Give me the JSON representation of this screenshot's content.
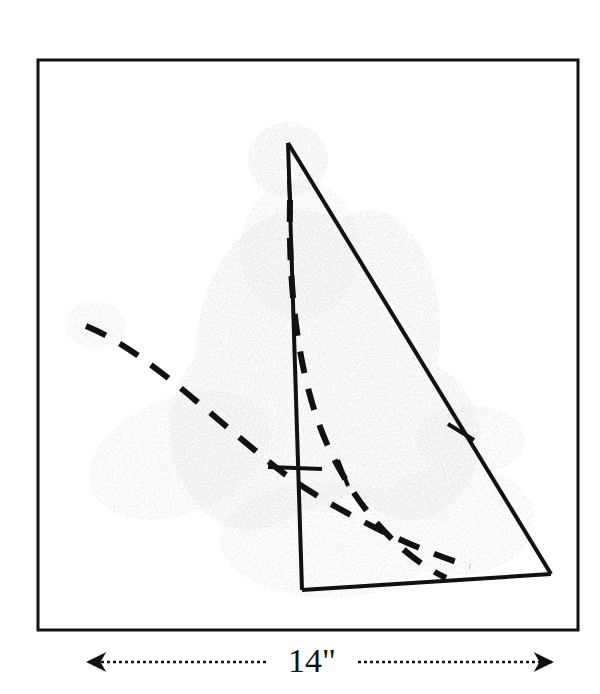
{
  "figure": {
    "kind": "technical-pattern-drawing",
    "title": "",
    "background_color": "#ffffff",
    "ink_color": "#111111",
    "speckle_color": "#b8b8b8"
  },
  "frame": {
    "name": "drawing-border",
    "x": 38,
    "y": 60,
    "width": 540,
    "height": 570,
    "stroke_width": 3,
    "stroke_color": "#111111",
    "fill": "#ffffff"
  },
  "shape": {
    "name": "sail-triangle",
    "stroke_color": "#111111",
    "stroke_width": 4,
    "vertices": {
      "apex": [
        288,
        143
      ],
      "bottom_left": [
        302,
        590
      ],
      "bottom_right": [
        551,
        574
      ]
    },
    "edges": [
      {
        "name": "mast-left-edge",
        "from": [
          288,
          143
        ],
        "to": [
          302,
          590
        ]
      },
      {
        "name": "leech-right-edge",
        "from": [
          288,
          143
        ],
        "to": [
          551,
          574
        ]
      },
      {
        "name": "foot-bottom-edge",
        "from": [
          302,
          590
        ],
        "to": [
          551,
          574
        ]
      }
    ]
  },
  "dashed_curves": [
    {
      "name": "outer-dashed-arc",
      "stroke_color": "#111111",
      "stroke_width": 6,
      "dash_pattern": "22 16",
      "path": "M 86,326 C 150,352 225,430 290,478 C 345,516 420,552 470,566"
    },
    {
      "name": "inner-dashed-arc",
      "stroke_color": "#111111",
      "stroke_width": 6,
      "dash_pattern": "22 16",
      "path": "M 290,200 C 288,300 300,400 340,470 C 372,527 410,560 446,578"
    }
  ],
  "tick_marks": [
    {
      "name": "tick-apex",
      "from": [
        289,
        180
      ],
      "to": [
        291,
        215
      ],
      "stroke_width": 4
    },
    {
      "name": "tick-on-leech",
      "from": [
        448,
        424
      ],
      "to": [
        474,
        440
      ],
      "stroke_width": 4
    },
    {
      "name": "tick-on-arc-left",
      "from": [
        268,
        467
      ],
      "to": [
        322,
        469
      ],
      "stroke_width": 4
    },
    {
      "name": "tick-on-arc-right",
      "from": [
        338,
        460
      ],
      "to": [
        348,
        486
      ],
      "stroke_width": 4
    }
  ],
  "dimension": {
    "name": "width-dimension",
    "value_label": "14\"",
    "y": 662,
    "left_x": 88,
    "right_x": 552,
    "label_center_x": 312,
    "arrow_color": "#111111",
    "line_style": "dotted"
  },
  "scan_artifacts": {
    "name": "scan-speckle-texture",
    "color": "#c0c0c0",
    "note": "faint stippled paper/scan noise over central region"
  }
}
